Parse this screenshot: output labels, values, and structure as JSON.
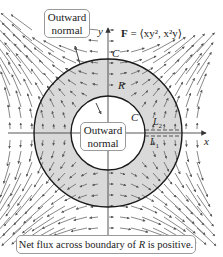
{
  "figure": {
    "field_label": {
      "bold_symbol": "F",
      "expression": " = ⟨xy², x²y⟩"
    },
    "axes": {
      "x_label": "x",
      "y_label": "y"
    },
    "curve_labels": {
      "outer": "C",
      "inner": "C",
      "region": "R",
      "segment_top": "L",
      "segment_top_sub": "2",
      "segment_bottom": "L",
      "segment_bottom_sub": "1"
    },
    "callouts": {
      "outer_normal": {
        "line1": "Outward",
        "line2": "normal"
      },
      "inner_normal": {
        "line1": "Outward",
        "line2": "normal"
      }
    },
    "caption": {
      "before": "Net flux across boundary of ",
      "italic": "R",
      "after": " is positive."
    },
    "colors": {
      "region_fill": "#d9d9d9",
      "curve_stroke": "#1a1a1a",
      "arrow_stroke": "#555555",
      "axis_stroke": "#444444",
      "box_border": "#9a9a9a"
    },
    "geometry": {
      "center_x": 108,
      "center_y": 133,
      "outer_radius": 74,
      "inner_radius": 37
    }
  }
}
